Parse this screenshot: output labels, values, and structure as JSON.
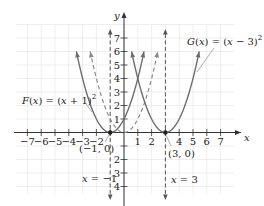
{
  "chart_data": {
    "type": "line",
    "title": "",
    "xlabel": "x",
    "ylabel": "y",
    "xlim": [
      -7.8,
      8
    ],
    "ylim": [
      -4.5,
      8
    ],
    "grid": true,
    "x_ticks": [
      -7,
      -6,
      -5,
      -4,
      -3,
      -2,
      -1,
      1,
      2,
      3,
      4,
      5,
      6,
      7
    ],
    "x_tick_labels": [
      "−7",
      "−6",
      "−5",
      "−4",
      "−3",
      "−2",
      "",
      "1",
      "2",
      "",
      "4",
      "5",
      "6",
      "7"
    ],
    "y_ticks": [
      -4,
      -3,
      -2,
      -1,
      1,
      2,
      3,
      4,
      5,
      6,
      7
    ],
    "y_tick_labels": [
      "4",
      "3",
      "2",
      "",
      "1",
      "2",
      "3",
      "4",
      "5",
      "6",
      "7"
    ],
    "series": [
      {
        "name": "y = x^2",
        "style": "dashed",
        "color": "#8a8a8a",
        "vertex": [
          0,
          0
        ],
        "x_range": [
          -2.45,
          2.45
        ],
        "arrows": true
      },
      {
        "name": "F(x) = (x + 1)^2",
        "style": "solid",
        "color": "#6e6e6e",
        "vertex": [
          -1,
          0
        ],
        "x_range": [
          -3.45,
          1.45
        ],
        "arrows": true
      },
      {
        "name": "G(x) = (x − 3)^2",
        "style": "solid",
        "color": "#6e6e6e",
        "vertex": [
          3,
          0
        ],
        "x_range": [
          0.55,
          5.45
        ],
        "arrows": true
      }
    ],
    "vertical_lines": [
      {
        "x": -1,
        "style": "dashed",
        "label": "x = −1"
      },
      {
        "x": 3,
        "style": "dashed",
        "label": "x = 3"
      }
    ],
    "points": [
      {
        "x": -1,
        "y": 0,
        "label": "(−1, 0)"
      },
      {
        "x": 3,
        "y": 0,
        "label": "(3, 0)"
      }
    ],
    "annotations": [
      {
        "text": "F(x) = (x + 1)²",
        "target": "F"
      },
      {
        "text": "G(x) = (x − 3)²",
        "target": "G"
      }
    ]
  },
  "labels": {
    "F": {
      "name": "F",
      "lhs_open": "(",
      "var": "x",
      "rhs": ") = (",
      "var2": "x",
      "tail": " + 1)",
      "exp": "2"
    },
    "G": {
      "name": "G",
      "lhs_open": "(",
      "var": "x",
      "rhs": ") = (",
      "var2": "x",
      "tail": " − 3)",
      "exp": "2"
    },
    "pt_left": "(−1, 0)",
    "pt_right": "(3, 0)",
    "vline_left": {
      "var": "x",
      "rest": " = −1"
    },
    "vline_right": {
      "var": "x",
      "rest": " = 3"
    },
    "x_axis": "x",
    "y_axis": "y"
  }
}
